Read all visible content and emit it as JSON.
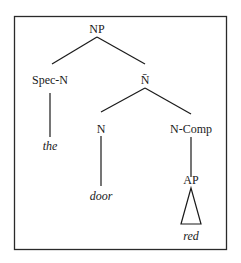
{
  "diagram": {
    "type": "syntax-tree",
    "nodes": {
      "root": {
        "label": "NP"
      },
      "spec": {
        "label": "Spec-N",
        "word": "the"
      },
      "nbar": {
        "label": "N̄"
      },
      "n": {
        "label": "N",
        "word": "door"
      },
      "ncomp": {
        "label": "N-Comp"
      },
      "ap": {
        "label": "AP",
        "word": "red"
      }
    },
    "edges": [
      [
        "NP",
        "Spec-N"
      ],
      [
        "NP",
        "N̄"
      ],
      [
        "Spec-N",
        "the"
      ],
      [
        "N̄",
        "N"
      ],
      [
        "N̄",
        "N-Comp"
      ],
      [
        "N",
        "door"
      ],
      [
        "N-Comp",
        "AP"
      ],
      [
        "AP",
        "red (triangle)"
      ]
    ],
    "colors": {
      "ink": "#1a1a1a",
      "background": "#ffffff"
    }
  }
}
